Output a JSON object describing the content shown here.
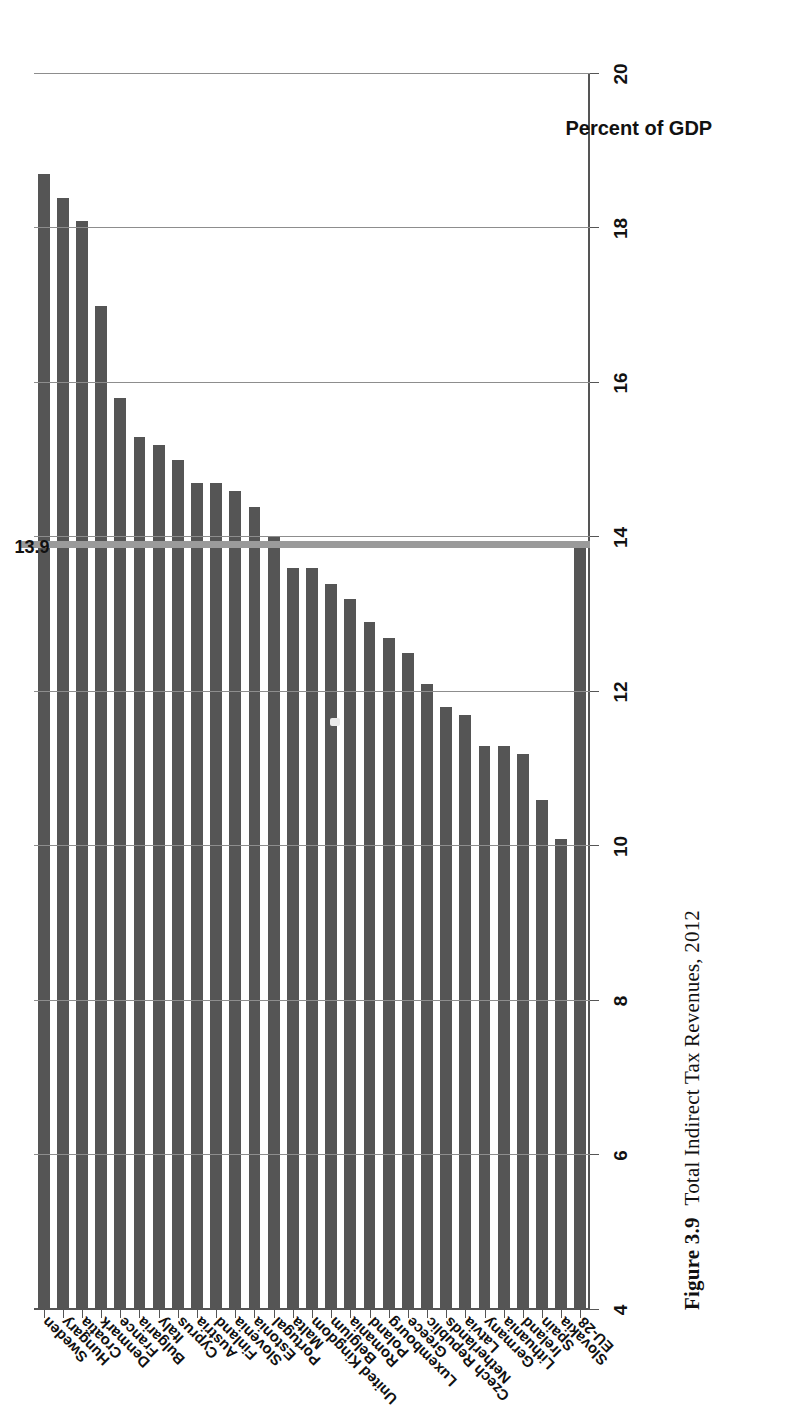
{
  "figure": {
    "number": "Figure 3.9",
    "caption": "Total Indirect Tax Revenues, 2012"
  },
  "axis_title": "Percent of GDP",
  "reference": {
    "label": "13.9",
    "value": 13.9,
    "name": "EU-28 average reference line",
    "color": "#9a9a9a"
  },
  "colors": {
    "bar": "#555555",
    "grid": "#8d8d8d",
    "axis": "#555555",
    "text": "#111111"
  },
  "chart_data": {
    "type": "bar",
    "orientation": "horizontal-rotated",
    "title": "Total Indirect Tax Revenues, 2012",
    "xlabel": "",
    "ylabel": "Percent of GDP",
    "ylim": [
      4,
      20
    ],
    "ticks": [
      20,
      18,
      16,
      14,
      12,
      10,
      8,
      6,
      4
    ],
    "grid": true,
    "legend": "none",
    "reference_line": {
      "label": "13.9",
      "value": 13.9
    },
    "categories": [
      "Sweden",
      "Hungary",
      "Croatia",
      "Denmark",
      "France",
      "Bulgaria",
      "Italy",
      "Cyprus",
      "Austria",
      "Finland",
      "Slovenia",
      "Estonia",
      "Portugal",
      "Malta",
      "United Kingdom",
      "Belgium",
      "Romania",
      "Poland",
      "Luxembourg",
      "Greece",
      "Czech Republic",
      "Netherlands",
      "Latvia",
      "Germany",
      "Lithuania",
      "Ireland",
      "Spain",
      "Slovakia",
      "EU-28"
    ],
    "values": [
      18.7,
      18.4,
      18.1,
      17.0,
      15.8,
      15.3,
      15.2,
      15.0,
      14.7,
      14.7,
      14.6,
      14.4,
      14.0,
      13.6,
      13.6,
      13.4,
      13.2,
      12.9,
      12.7,
      12.5,
      12.1,
      11.8,
      11.7,
      11.3,
      11.3,
      11.2,
      10.6,
      10.1,
      13.9
    ],
    "series": [
      {
        "name": "Total indirect tax revenues",
        "unit": "percent of GDP",
        "values": [
          18.7,
          18.4,
          18.1,
          17.0,
          15.8,
          15.3,
          15.2,
          15.0,
          14.7,
          14.7,
          14.6,
          14.4,
          14.0,
          13.6,
          13.6,
          13.4,
          13.2,
          12.9,
          12.7,
          12.5,
          12.1,
          11.8,
          11.7,
          11.3,
          11.3,
          11.2,
          10.6,
          10.1,
          13.9
        ]
      }
    ]
  }
}
